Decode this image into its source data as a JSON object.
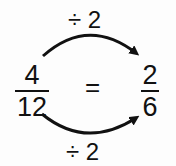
{
  "diagram": {
    "top_operation": "÷ 2",
    "bottom_operation": "÷ 2",
    "left_fraction": {
      "numerator": "4",
      "denominator": "12"
    },
    "equals": "=",
    "right_fraction": {
      "numerator": "2",
      "denominator": "6"
    },
    "arrows": [
      {
        "from": "left_fraction",
        "to": "right_fraction",
        "position": "top",
        "label": "÷ 2"
      },
      {
        "from": "left_fraction",
        "to": "right_fraction",
        "position": "bottom",
        "label": "÷ 2"
      }
    ],
    "colors": {
      "ink": "#111111",
      "background": "#fdfdfd"
    }
  }
}
